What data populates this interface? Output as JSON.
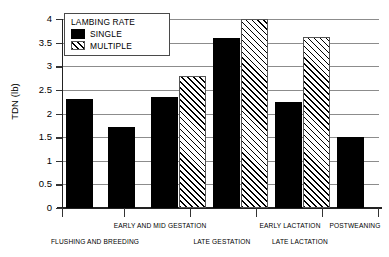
{
  "chart_data": {
    "type": "bar",
    "title": "",
    "xlabel": "",
    "ylabel": "TDN (lb)",
    "ylim": [
      0,
      4
    ],
    "ytick_labels": [
      "4",
      "3.5",
      "3",
      "2.5",
      "2",
      "1.5",
      "1",
      "0.5",
      "0"
    ],
    "ytick_values": [
      4,
      3.5,
      3,
      2.5,
      2,
      1.5,
      1,
      0.5,
      0
    ],
    "grid": true,
    "legend": {
      "title": "LAMBING RATE",
      "position": "top-left-inside",
      "entries": [
        {
          "name": "SINGLE",
          "fill": "solid-black",
          "color": "#000000"
        },
        {
          "name": "MULTIPLE",
          "fill": "diagonal-hatch",
          "color": "#000000"
        }
      ]
    },
    "categories": [
      "FLUSHING AND BREEDING",
      "EARLY AND MID GESTATION",
      "LATE GESTATION",
      "EARLY LACTATION",
      "LATE LACTATION",
      "POSTWEANING"
    ],
    "category_label_rows": [
      2,
      1,
      2,
      1,
      2,
      1
    ],
    "series": [
      {
        "name": "SINGLE",
        "values": [
          2.3,
          1.72,
          2.35,
          3.6,
          2.25,
          1.5
        ]
      },
      {
        "name": "MULTIPLE",
        "values": [
          null,
          null,
          2.8,
          4.0,
          3.62,
          null
        ]
      }
    ],
    "bars": [
      {
        "category": "FLUSHING AND BREEDING",
        "series": "SINGLE",
        "value": 2.3
      },
      {
        "category": "EARLY AND MID GESTATION",
        "series": "SINGLE",
        "value": 1.72
      },
      {
        "category": "LATE GESTATION",
        "series": "SINGLE",
        "value": 2.35
      },
      {
        "category": "LATE GESTATION",
        "series": "MULTIPLE",
        "value": 2.8
      },
      {
        "category": "EARLY LACTATION",
        "series": "SINGLE",
        "value": 3.6
      },
      {
        "category": "EARLY LACTATION",
        "series": "MULTIPLE",
        "value": 4.0
      },
      {
        "category": "LATE LACTATION",
        "series": "SINGLE",
        "value": 2.25
      },
      {
        "category": "LATE LACTATION",
        "series": "MULTIPLE",
        "value": 3.62
      },
      {
        "category": "POSTWEANING",
        "series": "SINGLE",
        "value": 1.5
      }
    ]
  }
}
